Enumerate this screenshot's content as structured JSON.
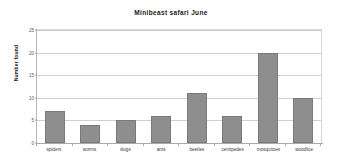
{
  "chart_data": {
    "type": "bar",
    "title": "Minibeast safari June",
    "xlabel": "",
    "ylabel": "Number found",
    "categories": [
      "spiders",
      "worms",
      "slugs",
      "ants",
      "beetles",
      "centipedes",
      "mosquitoes",
      "woodlice"
    ],
    "values": [
      7,
      4,
      5,
      6,
      11,
      6,
      20,
      10
    ],
    "ylim": [
      0,
      25
    ],
    "ytick_labels": [
      "25",
      "20",
      "15",
      "10",
      "5",
      "0"
    ],
    "ytick_values": [
      25,
      20,
      15,
      10,
      5,
      0
    ],
    "grid": "horizontal",
    "legend": "none",
    "bar_color": "#8e8e8e",
    "bar_edge_color": "#7a7a7a",
    "gridline_color": "#cfcfcf",
    "axis_color": "#aaaaaa",
    "background": "#ffffff"
  }
}
